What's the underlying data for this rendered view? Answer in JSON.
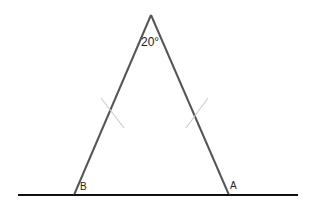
{
  "diagram": {
    "type": "isosceles-triangle",
    "apex_angle_label": "20°",
    "vertex_labels": {
      "left": "B",
      "right": "A"
    },
    "colors": {
      "triangle_stroke": "#555555",
      "baseline_stroke": "#111111",
      "tick_marks": "#cccccc"
    }
  }
}
